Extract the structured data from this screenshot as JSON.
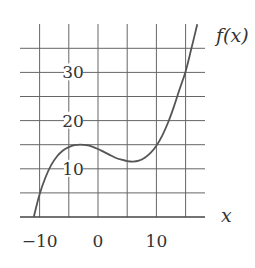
{
  "chart_data": {
    "type": "line",
    "title": "",
    "xlabel": "x",
    "ylabel": "f(x)",
    "xlim": [
      -14,
      18
    ],
    "ylim": [
      0,
      40
    ],
    "grid": true,
    "x_gridlines": [
      -10,
      -5,
      0,
      5,
      10,
      15
    ],
    "y_gridlines": [
      5,
      10,
      15,
      20,
      25,
      30,
      35
    ],
    "x_tick_labels": [
      {
        "value": -10,
        "label": "−10"
      },
      {
        "value": 0,
        "label": "0"
      },
      {
        "value": 10,
        "label": "10"
      }
    ],
    "y_tick_labels": [
      {
        "value": 10,
        "label": "10"
      },
      {
        "value": 20,
        "label": "20"
      },
      {
        "value": 30,
        "label": "30"
      }
    ],
    "series": [
      {
        "name": "f(x)",
        "x": [
          -11,
          -10,
          -9,
          -8,
          -7,
          -6,
          -5,
          -4,
          -3,
          -2,
          -1,
          0,
          1,
          2,
          3,
          4,
          5,
          6,
          7,
          8,
          9,
          10,
          11,
          12,
          13,
          14,
          15,
          16,
          17
        ],
        "values": [
          0,
          4.7,
          8.2,
          10.8,
          12.6,
          13.8,
          14.5,
          14.9,
          15.0,
          14.9,
          14.6,
          14.1,
          13.5,
          12.9,
          12.3,
          11.9,
          11.6,
          11.5,
          11.7,
          12.3,
          13.3,
          14.8,
          16.9,
          19.6,
          22.9,
          26.6,
          30.2,
          35.0,
          40.0
        ]
      }
    ]
  },
  "labels": {
    "y_axis_label": "f(x)",
    "x_axis_label": "x"
  }
}
